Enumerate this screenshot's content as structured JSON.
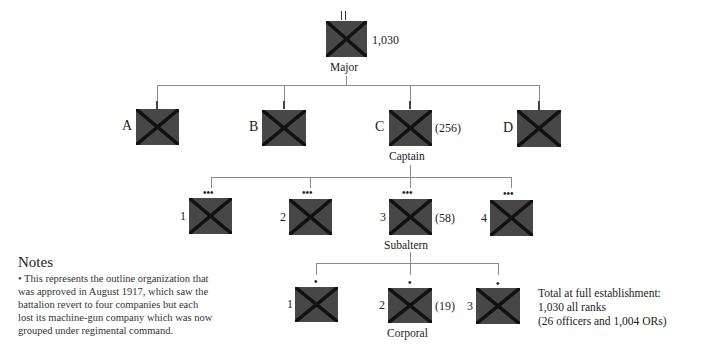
{
  "colors": {
    "unit_fill": "#474747",
    "unit_cross": "#111111",
    "connector": "#8a8a8a"
  },
  "battalion": {
    "symbol": "II",
    "strength": "1,030",
    "commander": "Major"
  },
  "companies": [
    {
      "letter": "A"
    },
    {
      "letter": "B"
    },
    {
      "letter": "C",
      "strength": "(256)",
      "commander": "Captain"
    },
    {
      "letter": "D"
    }
  ],
  "platoons": {
    "symbol": "•••",
    "items": [
      {
        "number": "1"
      },
      {
        "number": "2"
      },
      {
        "number": "3",
        "strength": "(58)",
        "commander": "Subaltern"
      },
      {
        "number": "4"
      }
    ]
  },
  "sections": {
    "symbol": "•",
    "items": [
      {
        "number": "1"
      },
      {
        "number": "2",
        "strength": "(19)",
        "commander": "Corporal"
      },
      {
        "number": "3"
      }
    ]
  },
  "notes": {
    "title": "Notes",
    "lines": [
      "• This represents the outline organization that",
      "was approved in August 1917, which saw the",
      "battalion revert to four companies but each",
      "lost its machine-gun company which was now",
      "grouped under regimental command."
    ]
  },
  "total": {
    "lines": [
      "Total at full establishment:",
      "1,030 all ranks",
      "(26 officers and 1,004 ORs)"
    ]
  }
}
